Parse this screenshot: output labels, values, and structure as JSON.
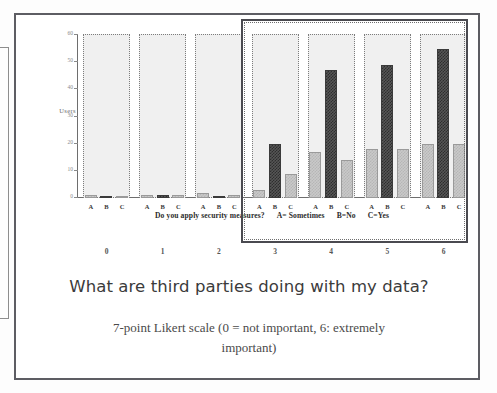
{
  "chart_data": {
    "type": "bar",
    "title": "",
    "xlabel": "Do you apply security measures?   A= Sometimes   B=No   C=Yes",
    "ylabel": "Users",
    "ylim": [
      0,
      60
    ],
    "yticks": [
      0,
      10,
      20,
      30,
      40,
      50,
      60
    ],
    "grid": false,
    "legend": "none",
    "categories": [
      "0",
      "1",
      "2",
      "3",
      "4",
      "5",
      "6"
    ],
    "group_tick_labels": [
      "A",
      "B",
      "C"
    ],
    "series": [
      {
        "name": "A",
        "values": [
          1,
          1,
          2,
          3,
          17,
          18,
          20
        ]
      },
      {
        "name": "B",
        "values": [
          0,
          1,
          0,
          20,
          47,
          49,
          55
        ]
      },
      {
        "name": "C",
        "values": [
          0,
          1,
          1,
          9,
          14,
          18,
          20
        ]
      }
    ],
    "highlight": {
      "label": "highlighted-groups",
      "categories": [
        "3",
        "4",
        "5",
        "6"
      ]
    }
  },
  "axis": {
    "y_label": "Users",
    "y_ticks": [
      "60",
      "50",
      "40",
      "30",
      "20",
      "10",
      "0"
    ],
    "x_group_labels": [
      "0",
      "1",
      "2",
      "3",
      "4",
      "5",
      "6"
    ],
    "bar_labels": [
      "A",
      "B",
      "C"
    ]
  },
  "x_caption": {
    "question": "Do you apply security measures?",
    "key_a": "A= Sometimes",
    "key_b": "B=No",
    "key_c": "C=Yes"
  },
  "captions": {
    "headline": "What  are third parties doing with my data?",
    "subcaption_line1": "7-point Likert scale (0 = not important, 6: extremely",
    "subcaption_line2": "important)"
  },
  "colors": {
    "bar_light": "#c9c9c9",
    "bar_dark": "#565656",
    "group_panel": "#f0f0f0",
    "frame": "#5d5d63",
    "highlight_border": "#4a4a50",
    "axis": "#6e6e6e",
    "text": "#3b3b3b"
  }
}
